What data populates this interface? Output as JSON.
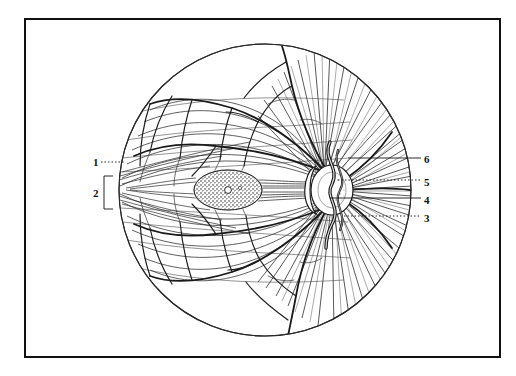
{
  "figure": {
    "background_color": "#ffffff",
    "ink_color": "#111111",
    "frame": {
      "border_color": "#111111",
      "border_width_px": 2,
      "x": 24,
      "y": 18,
      "width": 477,
      "height": 340
    },
    "fundus": {
      "center_x": 265,
      "center_y": 190,
      "radius": 147,
      "outline_color": "#222222"
    },
    "macula": {
      "center_x": 228,
      "center_y": 190,
      "rx": 34,
      "ry": 20,
      "fovea_x": 228,
      "fovea_y": 190,
      "shading": "stippled"
    },
    "optic_disc": {
      "center_x": 332,
      "center_y": 190,
      "rx": 22,
      "ry": 26
    }
  },
  "labels": [
    {
      "id": "label-1",
      "text": "1",
      "x": 93,
      "y": 157,
      "leader": {
        "style": "dotted",
        "x1": 101,
        "y1": 162,
        "x2": 124,
        "y2": 162
      }
    },
    {
      "id": "label-2",
      "text": "2",
      "x": 93,
      "y": 188,
      "leader": {
        "style": "bracket",
        "x": 104,
        "y_top": 176,
        "y_bottom": 209,
        "width": 9
      }
    },
    {
      "id": "label-3",
      "text": "3",
      "x": 424,
      "y": 213,
      "leader": {
        "style": "dotted",
        "x1": 344,
        "y1": 216,
        "x2": 421,
        "y2": 216
      }
    },
    {
      "id": "label-4",
      "text": "4",
      "x": 424,
      "y": 195,
      "leader": {
        "style": "dotted",
        "x1": 330,
        "y1": 198,
        "x2": 421,
        "y2": 198
      }
    },
    {
      "id": "label-5",
      "text": "5",
      "x": 424,
      "y": 177,
      "leader": {
        "style": "dotted",
        "x1": 338,
        "y1": 180,
        "x2": 421,
        "y2": 180
      }
    },
    {
      "id": "label-6",
      "text": "6",
      "x": 424,
      "y": 154,
      "leader": {
        "style": "solid",
        "x1": 348,
        "y1": 158,
        "x2": 421,
        "y2": 158
      }
    }
  ]
}
